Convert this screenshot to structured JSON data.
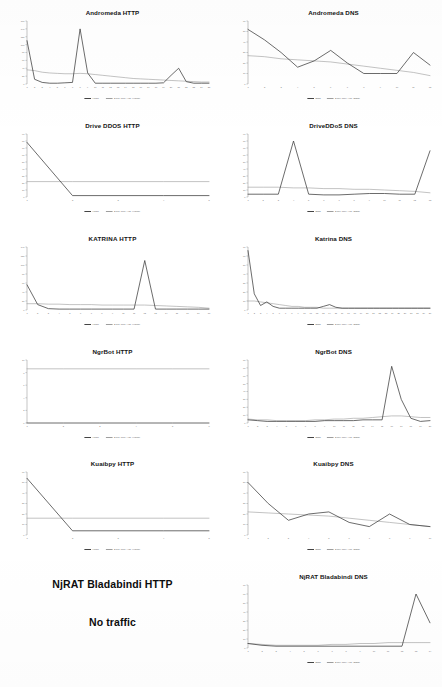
{
  "figure": {
    "legend_series_label": "HTTP/DNS",
    "legend_trend_label": "2 per. Mov. Avg. (Series)",
    "series_color": "#3b3b3b",
    "trend_color": "#9a9a9a",
    "axis_color": "#8a8a8a"
  },
  "no_traffic_cell": {
    "title": "NjRAT Bladabindi HTTP",
    "note": "No traffic"
  },
  "chart_data": [
    {
      "type": "line",
      "title": "Andromeda HTTP",
      "xlabel": "",
      "ylabel": "",
      "grid": false,
      "legend": "bottom",
      "x": [
        1,
        2,
        3,
        4,
        5,
        6,
        7,
        8,
        9,
        10,
        11,
        12,
        13,
        14,
        15,
        16,
        17,
        18,
        19,
        20,
        21,
        22,
        23,
        24,
        25
      ],
      "xticklabels": [
        "1",
        "2",
        "3",
        "4",
        "5",
        "6",
        "7",
        "8",
        "9",
        "10",
        "11",
        "12",
        "13",
        "14",
        "15",
        "16",
        "17",
        "18",
        "19",
        "20",
        "21",
        "22",
        "23",
        "24",
        "25"
      ],
      "ylim": [
        0,
        160
      ],
      "yticklabels": [
        "0",
        "20",
        "40",
        "60",
        "80",
        "100",
        "120",
        "140",
        "160"
      ],
      "series": [
        {
          "name": "HTTP",
          "values": [
            110,
            12,
            4,
            2,
            2,
            3,
            4,
            140,
            28,
            2,
            2,
            2,
            2,
            2,
            2,
            2,
            2,
            2,
            3,
            22,
            40,
            6,
            2,
            2,
            2
          ]
        },
        {
          "name": "2 per. Mov. Avg. (HTTP)",
          "values": [
            36,
            34,
            30,
            28,
            27,
            26,
            26,
            27,
            26,
            24,
            22,
            20,
            18,
            16,
            14,
            13,
            12,
            11,
            10,
            9,
            8,
            7,
            6,
            5,
            5
          ]
        }
      ]
    },
    {
      "type": "line",
      "title": "Andromeda DNS",
      "xlabel": "",
      "ylabel": "",
      "grid": false,
      "legend": "bottom",
      "x": [
        1,
        2,
        3,
        4,
        5,
        6,
        7,
        8,
        9,
        10,
        11,
        12
      ],
      "xticklabels": [
        "1",
        "2",
        "3",
        "4",
        "5",
        "6",
        "7",
        "8",
        "9",
        "10",
        "11",
        "12"
      ],
      "ylim": [
        0,
        60
      ],
      "yticklabels": [
        "0",
        "10",
        "20",
        "30",
        "40",
        "50",
        "60"
      ],
      "series": [
        {
          "name": "DNS",
          "values": [
            52,
            42,
            30,
            16,
            22,
            32,
            20,
            10,
            10,
            10,
            30,
            18
          ]
        },
        {
          "name": "2 per. Mov. Avg. (DNS)",
          "values": [
            27,
            26,
            24,
            23,
            22,
            21,
            19,
            17,
            15,
            13,
            11,
            8
          ]
        }
      ]
    },
    {
      "type": "line",
      "title": "Drive DDOS HTTP",
      "xlabel": "",
      "ylabel": "",
      "grid": false,
      "legend": "bottom",
      "x": [
        1,
        2,
        3,
        4,
        5
      ],
      "xticklabels": [
        "1",
        "2",
        "3",
        "4",
        "5"
      ],
      "ylim": [
        0,
        90
      ],
      "yticklabels": [
        "0",
        "10",
        "20",
        "30",
        "40",
        "50",
        "60",
        "70",
        "80",
        "90"
      ],
      "series": [
        {
          "name": "HTTP",
          "values": [
            78,
            2,
            2,
            2,
            2
          ]
        },
        {
          "name": "2 per. Mov. Avg. (HTTP)",
          "values": [
            22,
            22,
            22,
            22,
            22
          ]
        }
      ]
    },
    {
      "type": "line",
      "title": "DriveDDoS DNS",
      "xlabel": "",
      "ylabel": "",
      "grid": false,
      "legend": "bottom",
      "x": [
        1,
        2,
        3,
        4,
        5,
        6,
        7,
        8,
        9,
        10,
        11,
        12,
        13
      ],
      "xticklabels": [
        "1",
        "2",
        "3",
        "4",
        "5",
        "6",
        "7",
        "8",
        "9",
        "10",
        "11",
        "12",
        "13"
      ],
      "ylim": [
        0,
        90
      ],
      "yticklabels": [
        "0",
        "10",
        "20",
        "30",
        "40",
        "50",
        "60",
        "70",
        "80",
        "90"
      ],
      "series": [
        {
          "name": "DNS",
          "values": [
            4,
            4,
            4,
            80,
            4,
            3,
            3,
            4,
            5,
            5,
            4,
            4,
            66
          ]
        },
        {
          "name": "2 per. Mov. Avg. (DNS)",
          "values": [
            14,
            14,
            14,
            13,
            13,
            12,
            12,
            11,
            11,
            10,
            9,
            8,
            6
          ]
        }
      ]
    },
    {
      "type": "line",
      "title": "KATRINA HTTP",
      "xlabel": "",
      "ylabel": "",
      "grid": false,
      "legend": "bottom",
      "x": [
        1,
        2,
        3,
        4,
        5,
        6,
        7,
        8,
        9,
        10,
        11,
        12,
        13,
        14,
        15,
        16,
        17,
        18
      ],
      "xticklabels": [
        "1",
        "2",
        "3",
        "4",
        "5",
        "6",
        "7",
        "8",
        "9",
        "10",
        "11",
        "12",
        "13",
        "14",
        "15",
        "16",
        "17",
        "18"
      ],
      "ylim": [
        0,
        140
      ],
      "yticklabels": [
        "0",
        "20",
        "40",
        "60",
        "80",
        "100",
        "120",
        "140"
      ],
      "series": [
        {
          "name": "HTTP",
          "values": [
            56,
            12,
            3,
            2,
            2,
            2,
            2,
            2,
            2,
            2,
            2,
            110,
            2,
            2,
            2,
            2,
            2,
            2
          ]
        },
        {
          "name": "2 per. Mov. Avg. (HTTP)",
          "values": [
            14,
            14,
            13,
            13,
            12,
            12,
            12,
            11,
            11,
            11,
            11,
            11,
            10,
            9,
            8,
            7,
            6,
            4
          ]
        }
      ]
    },
    {
      "type": "line",
      "title": "Katrina DNS",
      "xlabel": "",
      "ylabel": "",
      "grid": false,
      "legend": "bottom",
      "x": [
        1,
        2,
        3,
        4,
        5,
        6,
        7,
        8,
        9,
        10,
        11,
        12,
        13,
        14,
        15,
        16,
        17,
        18,
        19,
        20,
        21,
        22,
        23,
        24,
        25,
        26,
        27,
        28,
        29,
        30
      ],
      "xticklabels": [
        "1",
        "2",
        "3",
        "4",
        "5",
        "6",
        "7",
        "8",
        "9",
        "10",
        "11",
        "12",
        "13",
        "14",
        "15",
        "16",
        "17",
        "18",
        "19",
        "20",
        "21",
        "22",
        "23",
        "24",
        "25",
        "26",
        "27",
        "28",
        "29",
        "30"
      ],
      "ylim": [
        0,
        70
      ],
      "yticklabels": [
        "0",
        "10",
        "20",
        "30",
        "40",
        "50",
        "60",
        "70"
      ],
      "series": [
        {
          "name": "DNS",
          "values": [
            66,
            18,
            5,
            9,
            4,
            2,
            2,
            2,
            2,
            2,
            2,
            2,
            4,
            6,
            3,
            2,
            2,
            2,
            2,
            2,
            2,
            2,
            2,
            2,
            2,
            2,
            2,
            2,
            2,
            2
          ]
        },
        {
          "name": "2 per. Mov. Avg. (DNS)",
          "values": [
            10,
            10,
            9,
            8,
            7,
            6,
            5,
            4,
            4,
            3,
            3,
            3,
            2,
            2,
            2,
            2,
            2,
            2,
            2,
            2,
            2,
            2,
            2,
            2,
            2,
            2,
            2,
            2,
            2,
            2
          ]
        }
      ]
    },
    {
      "type": "line",
      "title": "NgrBot HTTP",
      "xlabel": "",
      "ylabel": "",
      "grid": false,
      "legend": "bottom",
      "x": [
        1,
        2,
        3,
        4,
        5,
        6
      ],
      "xticklabels": [
        "1",
        "2",
        "3",
        "4",
        "5",
        "6"
      ],
      "ylim": [
        0,
        10
      ],
      "yticklabels": [
        "0",
        "2",
        "4",
        "6",
        "8",
        "10"
      ],
      "series": [
        {
          "name": "HTTP",
          "values": [
            0,
            0,
            0,
            0,
            0,
            0
          ]
        },
        {
          "name": "2 per. Mov. Avg. (HTTP)",
          "values": [
            8.6,
            8.6,
            8.6,
            8.6,
            8.6,
            8.6
          ]
        }
      ]
    },
    {
      "type": "line",
      "title": "NgrBot DNS",
      "xlabel": "",
      "ylabel": "",
      "grid": false,
      "legend": "bottom",
      "x": [
        1,
        2,
        3,
        4,
        5,
        6,
        7,
        8,
        9,
        10,
        11,
        12,
        13,
        14,
        15,
        16,
        17,
        18,
        19,
        20
      ],
      "xticklabels": [
        "1",
        "2",
        "3",
        "4",
        "5",
        "6",
        "7",
        "8",
        "9",
        "10",
        "11",
        "12",
        "13",
        "14",
        "15",
        "16",
        "17",
        "18",
        "19",
        "20"
      ],
      "ylim": [
        0,
        80
      ],
      "yticklabels": [
        "0",
        "10",
        "20",
        "30",
        "40",
        "50",
        "60",
        "70",
        "80"
      ],
      "series": [
        {
          "name": "DNS",
          "values": [
            4,
            3,
            2,
            2,
            2,
            2,
            2,
            2,
            3,
            3,
            3,
            3,
            4,
            4,
            4,
            72,
            30,
            6,
            2,
            3
          ]
        },
        {
          "name": "2 per. Mov. Avg. (DNS)",
          "values": [
            5,
            4,
            4,
            3,
            3,
            3,
            3,
            4,
            4,
            5,
            5,
            6,
            6,
            7,
            8,
            9,
            9,
            8,
            7,
            7
          ]
        }
      ]
    },
    {
      "type": "line",
      "title": "Kuaibpy HTTP",
      "xlabel": "",
      "ylabel": "",
      "grid": false,
      "legend": "bottom",
      "x": [
        1,
        2,
        3,
        4,
        5
      ],
      "xticklabels": [
        "1",
        "2",
        "3",
        "4",
        "5"
      ],
      "ylim": [
        0,
        60
      ],
      "yticklabels": [
        "0",
        "10",
        "20",
        "30",
        "40",
        "50",
        "60"
      ],
      "series": [
        {
          "name": "HTTP",
          "values": [
            54,
            4,
            4,
            4,
            4
          ]
        },
        {
          "name": "2 per. Mov. Avg. (HTTP)",
          "values": [
            16,
            16,
            16,
            16,
            16
          ]
        }
      ]
    },
    {
      "type": "line",
      "title": "Kuaibpy DNS",
      "xlabel": "",
      "ylabel": "",
      "grid": false,
      "legend": "bottom",
      "x": [
        1,
        2,
        3,
        4,
        5,
        6,
        7,
        8,
        9,
        10
      ],
      "xticklabels": [
        "1",
        "2",
        "3",
        "4",
        "5",
        "6",
        "7",
        "8",
        "9",
        "10"
      ],
      "ylim": [
        0,
        60
      ],
      "yticklabels": [
        "0",
        "10",
        "20",
        "30",
        "40",
        "50",
        "60"
      ],
      "series": [
        {
          "name": "DNS",
          "values": [
            50,
            30,
            14,
            20,
            22,
            12,
            8,
            20,
            10,
            8
          ]
        },
        {
          "name": "2 per. Mov. Avg. (DNS)",
          "values": [
            22,
            21,
            20,
            19,
            18,
            16,
            14,
            12,
            10,
            8
          ]
        }
      ]
    },
    {
      "type": "line",
      "title": "NjRAT Bladabindi DNS",
      "xlabel": "",
      "ylabel": "",
      "grid": false,
      "legend": "bottom",
      "x": [
        1,
        2,
        3,
        4,
        5,
        6,
        7,
        8,
        9,
        10,
        11,
        12,
        13,
        14
      ],
      "xticklabels": [
        "1",
        "2",
        "3",
        "4",
        "5",
        "6",
        "7",
        "8",
        "9",
        "10",
        "11",
        "12",
        "13",
        "14"
      ],
      "ylim": [
        0,
        70
      ],
      "yticklabels": [
        "0",
        "10",
        "20",
        "30",
        "40",
        "50",
        "60",
        "70"
      ],
      "series": [
        {
          "name": "DNS",
          "values": [
            5,
            3,
            2,
            2,
            2,
            2,
            2,
            2,
            2,
            2,
            2,
            2,
            60,
            28
          ]
        },
        {
          "name": "2 per. Mov. Avg. (DNS)",
          "values": [
            5,
            4,
            3,
            3,
            3,
            3,
            4,
            4,
            5,
            5,
            6,
            6,
            6,
            6
          ]
        }
      ]
    }
  ]
}
